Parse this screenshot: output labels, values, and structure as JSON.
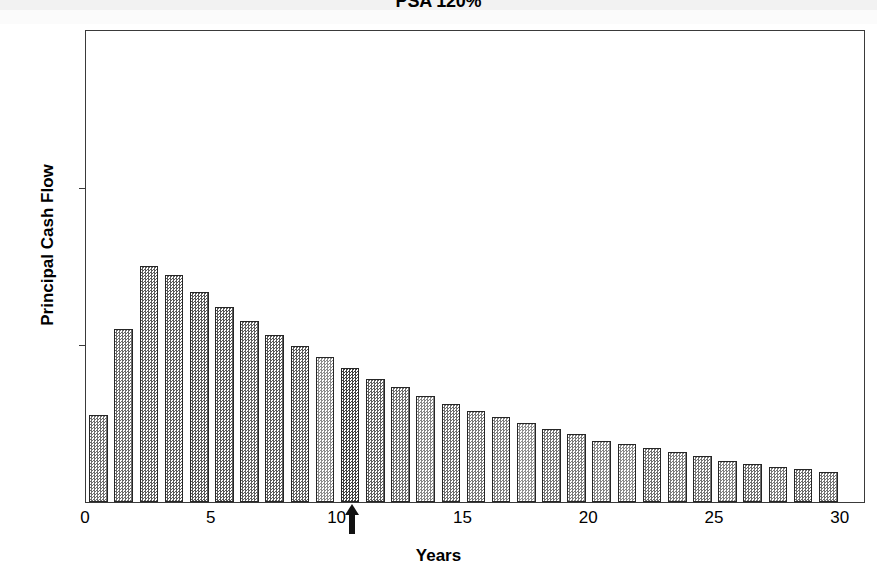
{
  "chart_data": {
    "type": "bar",
    "title": "PSA 120%",
    "xlabel": "Years",
    "ylabel": "Principal Cash Flow",
    "xlim": [
      0,
      31
    ],
    "ylim": [
      0,
      15
    ],
    "grid": false,
    "legend": null,
    "x_ticks": [
      "0",
      "5",
      "10",
      "15",
      "20",
      "25",
      "30"
    ],
    "x_tick_values": [
      0,
      5,
      10,
      15,
      20,
      25,
      30
    ],
    "y_ticks": [
      "0",
      "5",
      "10",
      "15"
    ],
    "y_tick_values": [
      0,
      5,
      10,
      15
    ],
    "categories": [
      1,
      2,
      3,
      4,
      5,
      6,
      7,
      8,
      9,
      10,
      11,
      12,
      13,
      14,
      15,
      16,
      17,
      18,
      19,
      20,
      21,
      22,
      23,
      24,
      25,
      26,
      27,
      28,
      29,
      30
    ],
    "values": [
      2.75,
      5.5,
      7.5,
      7.2,
      6.65,
      6.2,
      5.75,
      5.3,
      4.95,
      4.6,
      4.25,
      3.9,
      3.65,
      3.35,
      3.1,
      2.9,
      2.7,
      2.5,
      2.3,
      2.15,
      1.95,
      1.85,
      1.7,
      1.6,
      1.45,
      1.3,
      1.2,
      1.1,
      1.05,
      0.95
    ],
    "bar_shades": [
      "#6e6e6e",
      "#6a6a6a",
      "#5c5c5c",
      "#5a5a5a",
      "#555555",
      "#565656",
      "#5e5e5e",
      "#585858",
      "#5b5b5b",
      "#8c8c8c",
      "#3f3f3f",
      "#5f5f5f",
      "#6b6b6b",
      "#868686",
      "#6d6d6d",
      "#777777",
      "#7e7e7e",
      "#8f8f8f",
      "#727272",
      "#7a7a7a",
      "#848484",
      "#8a8a8a",
      "#6f6f6f",
      "#7c7c7c",
      "#747474",
      "#808080",
      "#6c6c6c",
      "#787878",
      "#6a6a6a",
      "#737373"
    ],
    "annotations": [
      {
        "name": "wal-arrow",
        "symbol": "up-arrow",
        "x_value": 10.6,
        "color": "#111111"
      }
    ]
  }
}
